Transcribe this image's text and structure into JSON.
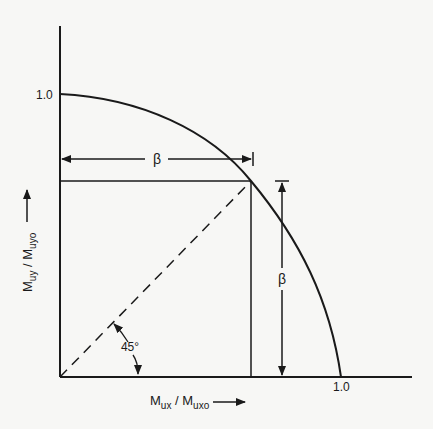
{
  "diagram": {
    "type": "biaxial-bending-interaction-curve",
    "y_axis": {
      "label_main": "M",
      "label_sub1": "uy",
      "label_sep": " / M",
      "label_sub2": "uyo",
      "tick_label": "1.0"
    },
    "x_axis": {
      "label_main": "M",
      "label_sub1": "ux",
      "label_sep": " / M",
      "label_sub2": "uxo",
      "tick_label": "1.0"
    },
    "beta_horizontal_label": "β",
    "beta_vertical_label": "β",
    "angle_label": "45°",
    "colors": {
      "ink": "#1a1a1a",
      "background": "#f7f7f5"
    }
  }
}
